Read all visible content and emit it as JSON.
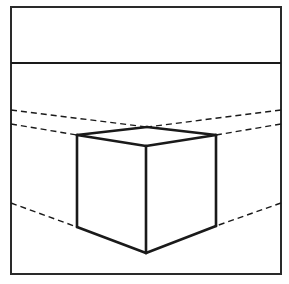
{
  "diagram": {
    "colors": {
      "background": "#ffffff",
      "ink": "#1a1a1a"
    },
    "frame": {
      "x": 11,
      "y": 7,
      "width": 270,
      "height": 267
    },
    "horizon": {
      "y": 63,
      "x1": 11,
      "x2": 281
    },
    "cube": {
      "top_back": [
        147,
        127
      ],
      "top_left": [
        77,
        135
      ],
      "top_right": [
        216,
        135
      ],
      "top_front": [
        146,
        146
      ],
      "bottom_left": [
        77,
        227
      ],
      "bottom_right": [
        216,
        226
      ],
      "bottom_front": [
        146,
        253
      ]
    },
    "construction_lines": [
      {
        "name": "upper-left",
        "from": [
          11,
          110
        ],
        "to": [
          147,
          127
        ]
      },
      {
        "name": "upper-right",
        "from": [
          281,
          110
        ],
        "to": [
          147,
          127
        ]
      },
      {
        "name": "mid-left",
        "from": [
          11,
          124
        ],
        "to": [
          77,
          135
        ]
      },
      {
        "name": "mid-right",
        "from": [
          281,
          124
        ],
        "to": [
          216,
          135
        ]
      },
      {
        "name": "lower-left",
        "from": [
          11,
          203
        ],
        "to": [
          77,
          227
        ]
      },
      {
        "name": "lower-right",
        "from": [
          281,
          203
        ],
        "to": [
          216,
          226
        ]
      }
    ]
  }
}
